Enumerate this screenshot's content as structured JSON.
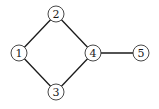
{
  "diagram": {
    "type": "graph",
    "nodes": [
      {
        "id": "1",
        "label": "1",
        "x": 19,
        "y": 53
      },
      {
        "id": "2",
        "label": "2",
        "x": 56,
        "y": 14
      },
      {
        "id": "3",
        "label": "3",
        "x": 56,
        "y": 92
      },
      {
        "id": "4",
        "label": "4",
        "x": 93,
        "y": 53
      },
      {
        "id": "5",
        "label": "5",
        "x": 141,
        "y": 53
      }
    ],
    "edges": [
      {
        "from": "1",
        "to": "2"
      },
      {
        "from": "1",
        "to": "3"
      },
      {
        "from": "2",
        "to": "4"
      },
      {
        "from": "3",
        "to": "4"
      },
      {
        "from": "4",
        "to": "5"
      }
    ],
    "node_radius": 8
  }
}
